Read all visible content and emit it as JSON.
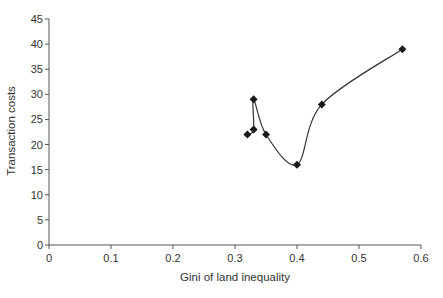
{
  "chart_data": {
    "type": "line",
    "title": "",
    "xlabel": "Gini of land inequality",
    "ylabel": "Transaction costs",
    "xlim": [
      0,
      0.6
    ],
    "ylim": [
      0,
      45
    ],
    "x_ticks": [
      0,
      0.1,
      0.2,
      0.3,
      0.4,
      0.5,
      0.6
    ],
    "x_tick_labels": [
      "0",
      "0.1",
      "0.2",
      "0.3",
      "0.4",
      "0.5",
      "0.6"
    ],
    "y_ticks": [
      0,
      5,
      10,
      15,
      20,
      25,
      30,
      35,
      40,
      45
    ],
    "y_tick_labels": [
      "0",
      "5",
      "10",
      "15",
      "20",
      "25",
      "30",
      "35",
      "40",
      "45"
    ],
    "grid": false,
    "legend": null,
    "line_style": "smoothed",
    "marker": "diamond",
    "series": [
      {
        "name": "Transaction costs",
        "x": [
          0.32,
          0.33,
          0.33,
          0.35,
          0.4,
          0.44,
          0.57
        ],
        "y": [
          22,
          23,
          29,
          22,
          16,
          28,
          39
        ]
      }
    ],
    "colors": {
      "line": "#333333",
      "marker": "#1a1a1a",
      "axis": "#555555",
      "text": "#333333"
    }
  }
}
